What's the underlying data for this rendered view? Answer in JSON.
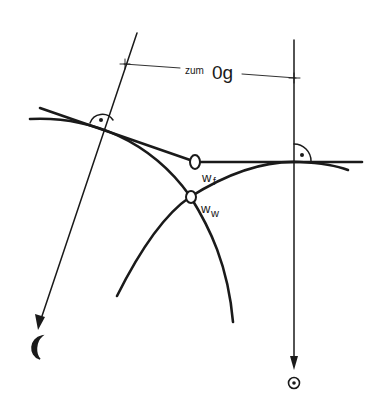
{
  "diagram": {
    "labels": {
      "dimension_prefix": "zum",
      "dimension_main": "0g",
      "point_f": "w",
      "point_f_sub": "f",
      "point_w": "w",
      "point_w_sub": "w"
    },
    "symbols": {
      "left_arrow_target": "moon-icon",
      "right_arrow_target": "sun-icon"
    },
    "colors": {
      "ink": "#1a1a1a",
      "background": "#ffffff"
    }
  }
}
